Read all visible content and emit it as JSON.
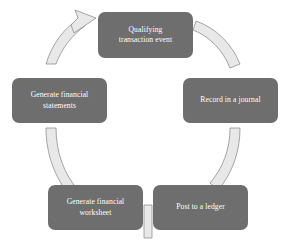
{
  "diagram": {
    "type": "cycle-diagram",
    "direction": "counterclockwise",
    "background_color": "#ffffff",
    "node_fill_color": "#6e6e6e",
    "node_text_color": "#ffffff",
    "ribbon_fill_color": "#e8e8e8",
    "ribbon_stroke_color": "#8a8a8a",
    "nodes": [
      {
        "id": "qualifying-transaction-event",
        "label": "Qualifying\ntransaction event",
        "position": "top"
      },
      {
        "id": "record-in-a-journal",
        "label": "Record in a journal",
        "position": "right"
      },
      {
        "id": "post-to-a-ledger",
        "label": "Post to a ledger",
        "position": "bottom-right"
      },
      {
        "id": "generate-financial-worksheet",
        "label": "Generate financial\nworksheet",
        "position": "bottom-left"
      },
      {
        "id": "generate-financial-statements",
        "label": "Generate financial\nstatements",
        "position": "left"
      }
    ],
    "connectors": [
      {
        "from": "qualifying-transaction-event",
        "to": "record-in-a-journal",
        "style": "ribbon"
      },
      {
        "from": "record-in-a-journal",
        "to": "post-to-a-ledger",
        "style": "ribbon"
      },
      {
        "from": "post-to-a-ledger",
        "to": "generate-financial-worksheet",
        "style": "ribbon"
      },
      {
        "from": "generate-financial-worksheet",
        "to": "generate-financial-statements",
        "style": "ribbon"
      },
      {
        "from": "generate-financial-statements",
        "to": "qualifying-transaction-event",
        "style": "ribbon-arrow"
      }
    ]
  }
}
